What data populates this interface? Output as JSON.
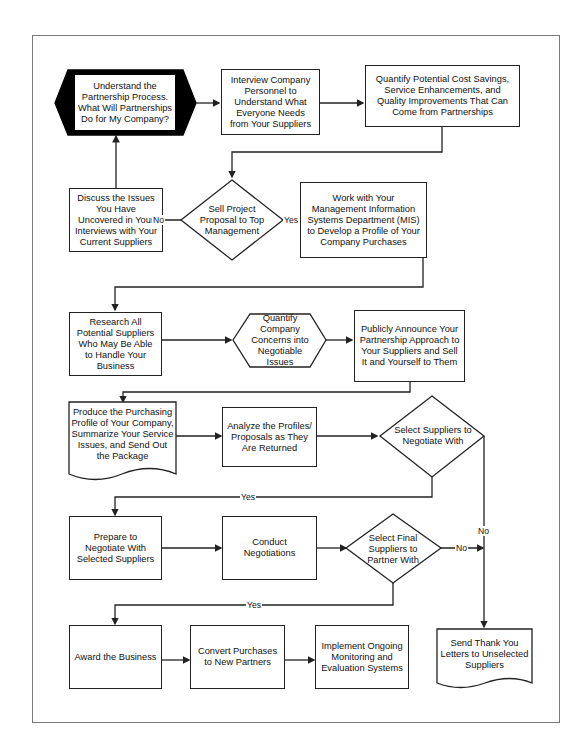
{
  "diagram": {
    "type": "flowchart",
    "nodes": {
      "n1": "Understand the Partnership Process. What Will Partnerships Do for My Company?",
      "n2": "Interview Company Personnel  to Understand What Everyone Needs from Your Suppliers",
      "n3": "Quantify Potential Cost Savings, Service Enhancements, and Quality Improvements That Can Come from Partnerships",
      "n4": "Discuss the Issues You Have Uncovered in Your Interviews with Your Current Suppliers",
      "d1": "Sell Project Proposal to Top Management",
      "n5": "Work with Your Management Information Systems Department (MIS) to Develop a Profile of Your Company Purchases",
      "n6": "Research All Potential Suppliers Who May Be Able to Handle Your Business",
      "n7": "Quantify Company Concerns into Negotiable Issues",
      "n8": "Publicly Announce Your Partnership Approach to Your Suppliers and Sell It and Yourself to Them",
      "n9": "Produce the Purchasing Profile of Your Company, Summarize Your Service Issues, and Send Out the Package",
      "n10": "Analyze the Profiles/ Proposals as They Are Returned",
      "d2": "Select Suppliers to Negotiate With",
      "n11": "Prepare to Negotiate With Selected Suppliers",
      "n12": "Conduct Negotiations",
      "d3": "Select Final Suppliers to Partner With",
      "n13": "Award the Business",
      "n14": "Convert Purchases to New Partners",
      "n15": "Implement Ongoing Monitoring and Evaluation Systems",
      "n16": "Send Thank You Letters to Unselected Suppliers"
    },
    "labels": {
      "d1_no": "No",
      "d1_yes": "Yes",
      "d2_yes": "Yes",
      "d2_no": "No",
      "d3_no": "No",
      "d3_yes": "Yes"
    },
    "colors": {
      "line": "#222222",
      "start_fill": "#000000",
      "frame": "#7a7a7a"
    }
  }
}
